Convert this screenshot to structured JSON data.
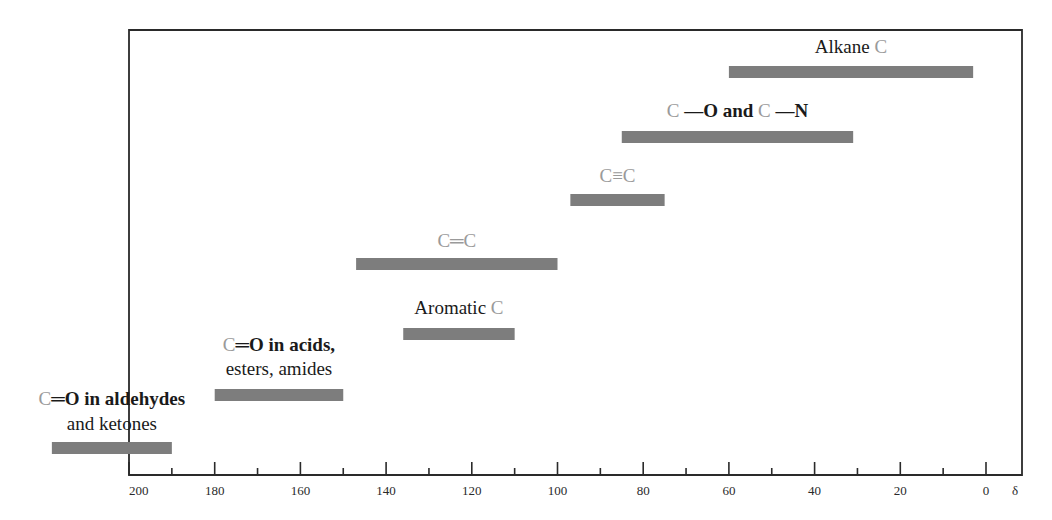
{
  "chart_data": {
    "type": "bar",
    "orientation": "horizontal-range",
    "title": "",
    "xlabel": "δ",
    "ylabel": "",
    "xlim": [
      200,
      0
    ],
    "x_reversed": true,
    "grid": false,
    "x_ticks_major": [
      200,
      180,
      160,
      140,
      120,
      100,
      80,
      60,
      40,
      20,
      0
    ],
    "x_tick_labels": [
      "200",
      "180",
      "160",
      "140",
      "120",
      "100",
      "80",
      "60",
      "40",
      "20",
      "0"
    ],
    "x_ticks_minor": [
      190,
      170,
      150,
      130,
      110,
      90,
      70,
      50,
      30,
      10
    ],
    "axis_unit_label": "δ",
    "series": [
      {
        "name": "C=O in aldehydes and ketones",
        "label_lines": [
          [
            {
              "t": "C",
              "g": true
            },
            {
              "t": "═O in aldehydes",
              "g": false
            }
          ],
          [
            {
              "t": "and ketones",
              "g": false
            }
          ]
        ],
        "start": 218,
        "end": 190
      },
      {
        "name": "C=O in acids, esters, amides",
        "label_lines": [
          [
            {
              "t": "C",
              "g": true
            },
            {
              "t": "═O in acids,",
              "g": false
            }
          ],
          [
            {
              "t": "esters, amides",
              "g": false
            }
          ]
        ],
        "start": 180,
        "end": 150
      },
      {
        "name": "Aromatic C",
        "label_lines": [
          [
            {
              "t": "Aromatic ",
              "g": false
            },
            {
              "t": "C",
              "g": true
            }
          ]
        ],
        "start": 136,
        "end": 110
      },
      {
        "name": "C=C",
        "label_lines": [
          [
            {
              "t": "C═C",
              "g": true
            }
          ]
        ],
        "start": 147,
        "end": 100
      },
      {
        "name": "C≡C",
        "label_lines": [
          [
            {
              "t": "C≡C",
              "g": true
            }
          ]
        ],
        "start": 97,
        "end": 75
      },
      {
        "name": "C—O and C—N",
        "label_lines": [
          [
            {
              "t": "C",
              "g": true
            },
            {
              "t": " —O and ",
              "g": false
            },
            {
              "t": "C",
              "g": true
            },
            {
              "t": " —N",
              "g": false
            }
          ]
        ],
        "start": 85,
        "end": 31
      },
      {
        "name": "Alkane C",
        "label_lines": [
          [
            {
              "t": "Alkane ",
              "g": false
            },
            {
              "t": "C",
              "g": true
            }
          ]
        ],
        "start": 60,
        "end": 3
      }
    ],
    "colors": {
      "bar": "#7d7d7d",
      "carbon_symbol": "#9a9a9a",
      "text": "#1a1a1a",
      "axis": "#2a2a2a"
    }
  }
}
